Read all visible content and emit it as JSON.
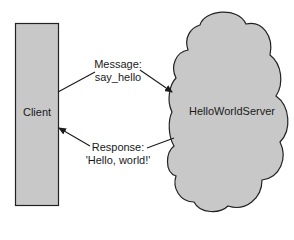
{
  "diagram": {
    "client": {
      "label": "Client",
      "fill": "#c8c8c8",
      "stroke": "#222222"
    },
    "server": {
      "label": "HelloWorldServer",
      "fill": "#c8c8c8",
      "stroke": "#222222"
    },
    "request": {
      "line1": "Message:",
      "line2": "say_hello",
      "direction": "client-to-server"
    },
    "response": {
      "line1": "Response:",
      "line2": "'Hello, world!'",
      "direction": "server-to-client"
    }
  }
}
